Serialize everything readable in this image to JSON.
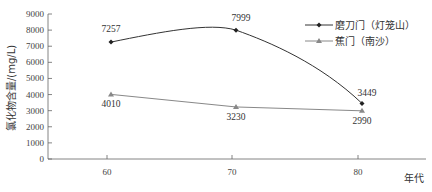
{
  "chart_data": {
    "type": "line",
    "title": "",
    "xlabel": "年代",
    "ylabel": "氯化物含量/(mg/L)",
    "categories": [
      "60",
      "70",
      "80"
    ],
    "ylim": [
      0,
      9000
    ],
    "yticks": [
      "0",
      "1000",
      "2000",
      "3000",
      "4000",
      "5000",
      "6000",
      "7000",
      "8000",
      "9000"
    ],
    "grid": false,
    "legend_position": "top-right",
    "series": [
      {
        "name": "磨刀门（灯笼山）",
        "marker": "diamond",
        "color": "#333333",
        "smooth": true,
        "values": [
          7257,
          7999,
          3449
        ],
        "labels": [
          "7257",
          "7999",
          "3449"
        ]
      },
      {
        "name": "蕉门（南沙）",
        "marker": "triangle",
        "color": "#888888",
        "smooth": false,
        "values": [
          4010,
          3230,
          2990
        ],
        "labels": [
          "4010",
          "3230",
          "2990"
        ]
      }
    ]
  }
}
